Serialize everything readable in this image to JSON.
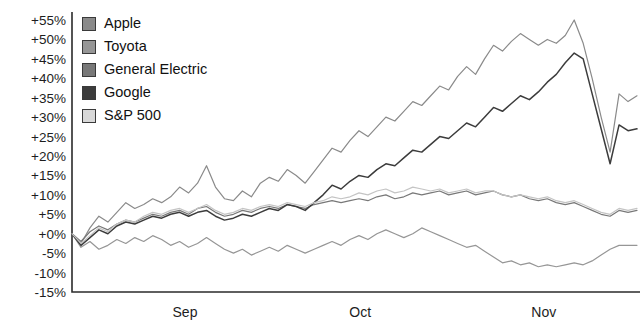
{
  "chart_data": {
    "type": "line",
    "title": "",
    "subtitle": "",
    "xlabel": "",
    "ylabel": "",
    "grid": false,
    "legend_position": "top-left",
    "ylim": [
      -15,
      55
    ],
    "ytick_labels": [
      "+55%",
      "+50%",
      "+45%",
      "+40%",
      "+35%",
      "+30%",
      "+25%",
      "+20%",
      "+15%",
      "+10%",
      "+5%",
      "+0%",
      "-5%",
      "-10%",
      "-15%"
    ],
    "ytick_values": [
      55,
      50,
      45,
      40,
      35,
      30,
      25,
      20,
      15,
      10,
      5,
      0,
      -5,
      -10,
      -15
    ],
    "xtick_labels": [
      "Sep",
      "Oct",
      "Nov"
    ],
    "xtick_positions": [
      0.2,
      0.51,
      0.835
    ],
    "x": [
      0,
      1,
      2,
      3,
      4,
      5,
      6,
      7,
      8,
      9,
      10,
      11,
      12,
      13,
      14,
      15,
      16,
      17,
      18,
      19,
      20,
      21,
      22,
      23,
      24,
      25,
      26,
      27,
      28,
      29,
      30,
      31,
      32,
      33,
      34,
      35,
      36,
      37,
      38,
      39,
      40,
      41,
      42,
      43,
      44,
      45,
      46,
      47,
      48,
      49,
      50,
      51,
      52,
      53,
      54,
      55,
      56,
      57,
      58,
      59,
      60,
      61,
      62,
      63
    ],
    "series": [
      {
        "name": "Apple",
        "color": "#8a8a8a",
        "values": [
          0,
          -2.5,
          1.5,
          4.5,
          3.0,
          5.5,
          8.0,
          6.5,
          7.5,
          9.0,
          8.0,
          9.5,
          12.0,
          10.5,
          13.0,
          17.5,
          12.0,
          9.0,
          8.5,
          11.0,
          9.5,
          13.0,
          14.5,
          13.5,
          16.5,
          15.0,
          13.0,
          16.0,
          19.0,
          22.0,
          21.0,
          24.0,
          26.5,
          25.0,
          27.5,
          30.0,
          29.0,
          31.5,
          34.0,
          33.0,
          35.5,
          38.0,
          37.0,
          40.5,
          43.0,
          41.0,
          45.0,
          48.5,
          47.0,
          49.5,
          51.5,
          50.0,
          48.5,
          50.0,
          49.0,
          51.0,
          55.0,
          49.0,
          40.0,
          30.0,
          21.0,
          36.0,
          34.0,
          35.5
        ]
      },
      {
        "name": "Toyota",
        "color": "#969696",
        "values": [
          0,
          -3.5,
          -2.0,
          -4.0,
          -3.0,
          -1.5,
          -2.5,
          -1.0,
          -2.0,
          -0.5,
          -1.5,
          -3.0,
          -2.0,
          -3.5,
          -2.5,
          -1.0,
          -2.5,
          -4.0,
          -5.0,
          -4.0,
          -5.5,
          -4.5,
          -3.5,
          -4.5,
          -3.0,
          -4.0,
          -5.0,
          -4.0,
          -3.0,
          -2.0,
          -3.0,
          -1.5,
          -0.5,
          -1.5,
          0.0,
          1.0,
          0.0,
          -1.0,
          0.0,
          1.5,
          0.5,
          -0.5,
          -1.5,
          -2.5,
          -3.5,
          -3.0,
          -4.5,
          -6.0,
          -7.5,
          -7.0,
          -8.0,
          -7.5,
          -8.5,
          -8.0,
          -8.5,
          -8.0,
          -7.5,
          -8.0,
          -7.0,
          -5.5,
          -4.0,
          -3.0,
          -3.0,
          -3.0
        ]
      },
      {
        "name": "General Electric",
        "color": "#787878",
        "values": [
          0,
          -2.0,
          0.5,
          2.0,
          1.0,
          2.5,
          3.5,
          3.0,
          4.0,
          5.0,
          4.5,
          5.5,
          6.0,
          5.0,
          6.5,
          7.0,
          5.5,
          4.5,
          5.0,
          6.0,
          5.5,
          6.5,
          7.0,
          6.5,
          7.5,
          7.0,
          6.5,
          7.5,
          8.0,
          8.5,
          8.0,
          8.5,
          9.0,
          8.5,
          9.5,
          10.0,
          9.0,
          9.5,
          10.5,
          10.0,
          10.5,
          11.0,
          10.0,
          10.5,
          11.0,
          10.0,
          10.5,
          11.0,
          10.0,
          9.5,
          10.0,
          9.0,
          8.5,
          9.0,
          8.0,
          7.5,
          8.0,
          7.0,
          6.0,
          5.0,
          4.5,
          6.0,
          5.5,
          6.0
        ]
      },
      {
        "name": "Google",
        "color": "#3c3c3c",
        "values": [
          0,
          -3.0,
          -1.0,
          1.0,
          0.0,
          2.0,
          3.0,
          2.5,
          3.5,
          4.5,
          4.0,
          5.0,
          5.5,
          4.5,
          5.5,
          6.0,
          4.5,
          3.5,
          4.0,
          5.0,
          4.5,
          5.5,
          6.5,
          6.0,
          7.5,
          7.0,
          6.0,
          8.0,
          10.0,
          12.5,
          11.5,
          13.5,
          15.0,
          14.5,
          16.5,
          18.0,
          17.5,
          19.5,
          21.5,
          21.0,
          23.0,
          25.0,
          24.5,
          26.5,
          28.5,
          27.5,
          30.0,
          32.5,
          31.5,
          33.5,
          35.5,
          34.5,
          36.5,
          39.0,
          41.0,
          44.0,
          46.5,
          45.0,
          36.0,
          27.0,
          18.0,
          28.0,
          26.5,
          27.0
        ]
      },
      {
        "name": "S&P 500",
        "color": "#c4c4c4",
        "values": [
          0,
          -2.5,
          -0.5,
          1.5,
          0.5,
          2.5,
          3.5,
          3.0,
          4.5,
          5.5,
          5.0,
          6.0,
          6.5,
          5.5,
          6.5,
          7.5,
          6.0,
          5.0,
          5.5,
          6.5,
          6.0,
          7.0,
          7.5,
          7.0,
          8.0,
          7.5,
          7.0,
          8.0,
          8.5,
          9.5,
          9.0,
          9.5,
          10.5,
          10.0,
          11.0,
          11.5,
          10.5,
          11.0,
          12.0,
          11.5,
          11.0,
          11.5,
          10.5,
          11.0,
          11.5,
          10.5,
          11.0,
          11.0,
          10.0,
          9.5,
          10.0,
          9.5,
          9.0,
          9.5,
          8.5,
          8.0,
          8.5,
          7.5,
          6.5,
          5.5,
          5.0,
          6.5,
          6.0,
          6.5
        ]
      }
    ]
  },
  "legend": {
    "items": [
      {
        "label": "Apple",
        "color": "#8a8a8a"
      },
      {
        "label": "Toyota",
        "color": "#969696"
      },
      {
        "label": "General Electric",
        "color": "#787878"
      },
      {
        "label": "Google",
        "color": "#3c3c3c"
      },
      {
        "label": "S&P 500",
        "color": "#d8d8d8"
      }
    ]
  }
}
